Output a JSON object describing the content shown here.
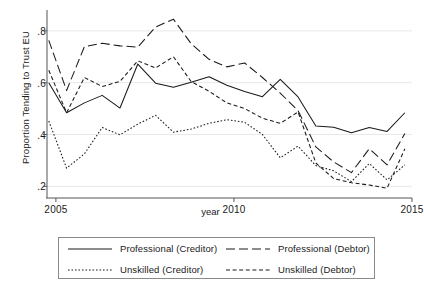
{
  "chart_data": {
    "type": "line",
    "title": "",
    "xlabel": "year",
    "ylabel": "Proportion Tending to Trust EU",
    "xlim": [
      2004.75,
      2015.0
    ],
    "ylim": [
      0.155,
      0.865
    ],
    "xticks": [
      2005,
      2010,
      2015
    ],
    "xticklabels": [
      "2005",
      "2010",
      "2015"
    ],
    "yticks": [
      0.2,
      0.4,
      0.6,
      0.8
    ],
    "yticklabels": [
      ".2",
      ".4",
      ".6",
      ".8"
    ],
    "grid": "horizontal",
    "legend_position": "below-plot",
    "line_color": "#1a1a1a",
    "grid_color": "#e8e8e8",
    "axis_color": "#555555",
    "x": [
      2004.8,
      2005.3,
      2005.8,
      2006.3,
      2006.8,
      2007.3,
      2007.8,
      2008.3,
      2008.8,
      2009.3,
      2009.8,
      2010.3,
      2010.8,
      2011.3,
      2011.8,
      2012.3,
      2012.8,
      2013.3,
      2013.8,
      2014.3,
      2014.8
    ],
    "series": [
      {
        "name": "Professional (Creditor)",
        "dash": "solid",
        "values": [
          0.6,
          0.484,
          0.522,
          0.551,
          0.502,
          0.672,
          0.598,
          0.582,
          0.602,
          0.623,
          0.59,
          0.566,
          0.546,
          0.613,
          0.545,
          0.433,
          0.428,
          0.407,
          0.427,
          0.412,
          0.484
        ]
      },
      {
        "name": "Professional (Debtor)",
        "dash": "long-dash",
        "values": [
          0.763,
          0.57,
          0.739,
          0.752,
          0.742,
          0.737,
          0.815,
          0.845,
          0.75,
          0.69,
          0.661,
          0.676,
          0.62,
          0.56,
          0.492,
          0.352,
          0.294,
          0.253,
          0.345,
          0.283,
          0.404
        ]
      },
      {
        "name": "Unskilled (Creditor)",
        "dash": "dotted",
        "values": [
          0.452,
          0.27,
          0.325,
          0.427,
          0.399,
          0.44,
          0.474,
          0.409,
          0.421,
          0.443,
          0.457,
          0.447,
          0.4,
          0.31,
          0.355,
          0.28,
          0.26,
          0.218,
          0.288,
          0.225,
          0.283
        ]
      },
      {
        "name": "Unskilled (Debtor)",
        "dash": "short-dash",
        "values": [
          0.648,
          0.484,
          0.62,
          0.585,
          0.605,
          0.684,
          0.657,
          0.7,
          0.604,
          0.567,
          0.522,
          0.5,
          0.463,
          0.443,
          0.487,
          0.29,
          0.23,
          0.214,
          0.205,
          0.193,
          0.345
        ]
      }
    ]
  },
  "axis": {
    "ylabel": "Proportion Tending to Trust EU",
    "xlabel": "year",
    "yticklabels": [
      ".8",
      ".6",
      ".4",
      ".2"
    ],
    "xticklabels": [
      "2005",
      "2010",
      "2015"
    ]
  },
  "legend": {
    "entries": [
      {
        "label": "Professional (Creditor)",
        "dash": "solid"
      },
      {
        "label": "Unskilled (Creditor)",
        "dash": "dotted"
      },
      {
        "label": "Professional (Debtor)",
        "dash": "long-dash"
      },
      {
        "label": "Unskilled (Debtor)",
        "dash": "short-dash"
      }
    ]
  }
}
